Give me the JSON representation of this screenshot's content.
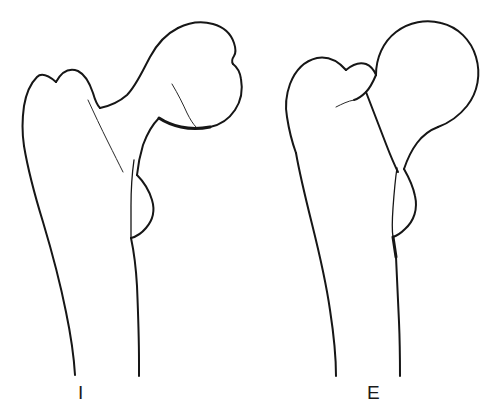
{
  "figure": {
    "background_color": "#ffffff",
    "ink_color": "#161616",
    "width": 497,
    "height": 419,
    "style": "black ink line art, no shading, white background",
    "panel_count": 2
  },
  "panels": [
    {
      "id": "internal",
      "label": "I",
      "label_meaning": "internal rotation view of proximal femur",
      "description": "Proximal femur with rounded femoral head directed up and to the right, short neck, broad greater trochanter on the left, small lesser trochanter bulge on the medial shaft, long tapering shaft",
      "parts": [
        "femoral head",
        "fovea notch",
        "femoral neck",
        "greater trochanter",
        "trochanteric fossa line",
        "lesser trochanter",
        "femoral shaft"
      ]
    },
    {
      "id": "external",
      "label": "E",
      "label_meaning": "external rotation view of proximal femur",
      "description": "Proximal femur with nearly circular femoral head at upper right overlapping a smaller rounded greater trochanter at upper left, short foreshortened neck, lesser trochanter projecting on the medial side, long tapering shaft",
      "parts": [
        "femoral head",
        "femoral neck",
        "greater trochanter",
        "intertrochanteric line",
        "lesser trochanter",
        "femoral shaft"
      ]
    }
  ],
  "labels": {
    "internal": "I",
    "external": "E"
  }
}
